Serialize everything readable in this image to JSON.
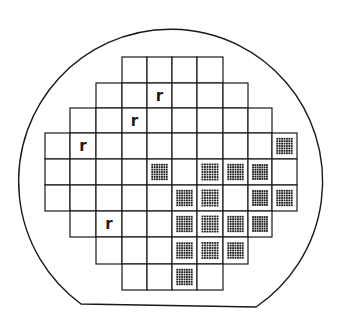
{
  "figure": {
    "type": "wafer-map",
    "width": 339,
    "height": 325,
    "colors": {
      "line": "#1a1a1a",
      "background": "#ffffff"
    },
    "outline": {
      "shape": "circle-with-flat",
      "center_x": 170,
      "center_y": 170,
      "radius": 152,
      "flat_left": [
        81,
        304
      ],
      "flat_right": [
        256,
        307
      ]
    },
    "grid": {
      "col_edges": [
        45,
        70,
        96,
        122,
        147,
        172,
        197,
        223,
        248,
        272,
        297
      ],
      "row_edges": [
        57,
        83,
        108,
        133,
        159,
        185,
        211,
        237,
        264,
        290
      ]
    },
    "legend_note": "r = marked die; dotted = patterned die; blank = empty die",
    "rows": [
      {
        "row": 0,
        "cells": [
          "",
          "",
          "",
          "blank",
          "blank",
          "blank",
          "blank",
          "",
          "",
          ""
        ]
      },
      {
        "row": 1,
        "cells": [
          "",
          "",
          "blank",
          "blank",
          "r",
          "blank",
          "blank",
          "blank",
          "",
          ""
        ]
      },
      {
        "row": 2,
        "cells": [
          "",
          "blank",
          "blank",
          "r",
          "blank",
          "blank",
          "blank",
          "blank",
          "blank",
          ""
        ]
      },
      {
        "row": 3,
        "cells": [
          "blank",
          "r",
          "blank",
          "blank",
          "blank",
          "blank",
          "blank",
          "blank",
          "blank",
          "dots"
        ]
      },
      {
        "row": 4,
        "cells": [
          "blank",
          "blank",
          "blank",
          "blank",
          "dots",
          "blank",
          "dots",
          "dots",
          "dots",
          "blank"
        ]
      },
      {
        "row": 5,
        "cells": [
          "blank",
          "blank",
          "blank",
          "blank",
          "blank",
          "dots",
          "dots",
          "blank",
          "dots",
          "dots"
        ]
      },
      {
        "row": 6,
        "cells": [
          "",
          "blank",
          "r",
          "blank",
          "blank",
          "dots",
          "dots",
          "dots",
          "dots",
          ""
        ]
      },
      {
        "row": 7,
        "cells": [
          "",
          "",
          "blank",
          "blank",
          "blank",
          "dots",
          "dots",
          "dots",
          "",
          ""
        ]
      },
      {
        "row": 8,
        "cells": [
          "",
          "",
          "",
          "blank",
          "blank",
          "dots",
          "blank",
          "",
          "",
          ""
        ]
      }
    ],
    "mark_label": "r",
    "dot_pattern": {
      "rows": 7,
      "cols": 7
    },
    "counts": {
      "total_dies": 66,
      "marked_r": 4,
      "dotted": 18
    }
  }
}
